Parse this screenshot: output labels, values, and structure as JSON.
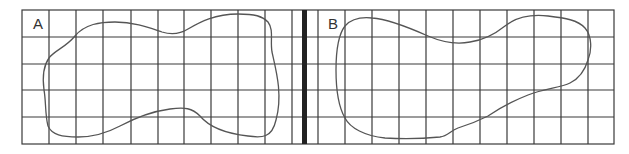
{
  "figure": {
    "panels": [
      {
        "label": "A",
        "shape": "irregular closed blob"
      },
      {
        "label": "B",
        "shape": "irregular closed blob"
      }
    ],
    "grid": {
      "rows": 5,
      "columns_total": 22,
      "divider": "thick vertical line between panel A and panel B",
      "line_color": "#333333",
      "shape_stroke_color": "#555555"
    }
  }
}
